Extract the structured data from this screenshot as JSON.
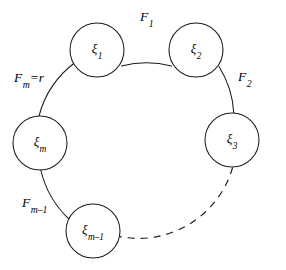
{
  "figure": {
    "type": "cycle-graph-diagram",
    "background_color": "#ffffff",
    "stroke_color": "#1a1a1a",
    "width": 286,
    "height": 270
  },
  "ring": {
    "center_x": 136,
    "center_y": 140,
    "radius": 98
  },
  "nodes": [
    {
      "id": "xi-1",
      "base": "ξ",
      "subscript": "1",
      "cx": 97,
      "cy": 50,
      "r": 27
    },
    {
      "id": "xi-2",
      "base": "ξ",
      "subscript": "2",
      "cx": 196,
      "cy": 50,
      "r": 27
    },
    {
      "id": "xi-3",
      "base": "ξ",
      "subscript": "3",
      "cx": 232,
      "cy": 140,
      "r": 27
    },
    {
      "id": "xi-m",
      "base": "ξ",
      "subscript": "m",
      "cx": 40,
      "cy": 143,
      "r": 27
    },
    {
      "id": "xi-m-minus-1",
      "base": "ξ",
      "subscript": "m–1",
      "cx": 93,
      "cy": 231,
      "r": 27
    }
  ],
  "edge_labels": [
    {
      "id": "F-1",
      "base": "F",
      "subscript": "1",
      "suffix": "",
      "x": 140,
      "y": 10
    },
    {
      "id": "F-2",
      "base": "F",
      "subscript": "2",
      "suffix": "",
      "x": 238,
      "y": 70
    },
    {
      "id": "F-m-equals-r",
      "base": "F",
      "subscript": "m",
      "suffix": "=r",
      "x": 14,
      "y": 71
    },
    {
      "id": "F-m-minus-1",
      "base": "F",
      "subscript": "m–1",
      "suffix": "",
      "x": 22,
      "y": 196
    }
  ],
  "arcs": [
    {
      "id": "arc-xi1-xi2",
      "style": "solid",
      "from": "xi-1",
      "to": "xi-2"
    },
    {
      "id": "arc-xi2-xi3",
      "style": "solid",
      "from": "xi-2",
      "to": "xi-3"
    },
    {
      "id": "arc-xi3-xim1",
      "style": "dashed",
      "from": "xi-3",
      "to": "xi-m-minus-1"
    },
    {
      "id": "arc-xim1-xim",
      "style": "solid",
      "from": "xi-m-minus-1",
      "to": "xi-m"
    },
    {
      "id": "arc-xim-xi1",
      "style": "solid",
      "from": "xi-m",
      "to": "xi-1"
    }
  ]
}
